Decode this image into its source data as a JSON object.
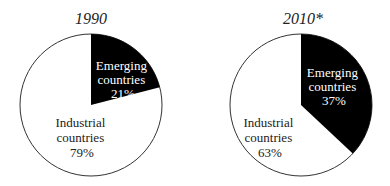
{
  "chart_data": [
    {
      "type": "pie",
      "title": "1990",
      "slices": [
        {
          "label": "Emerging countries",
          "value": 21,
          "display": "21%",
          "color": "#000000"
        },
        {
          "label": "Industrial countries",
          "value": 79,
          "display": "79%",
          "color": "#ffffff"
        }
      ]
    },
    {
      "type": "pie",
      "title": "2010*",
      "slices": [
        {
          "label": "Emerging countries",
          "value": 37,
          "display": "37%",
          "color": "#000000"
        },
        {
          "label": "Industrial countries",
          "value": 63,
          "display": "63%",
          "color": "#ffffff"
        }
      ]
    }
  ],
  "labels": {
    "pie1": {
      "title": "1990",
      "emerging_line1": "Emerging",
      "emerging_line2": "countries",
      "emerging_pct": "21%",
      "industrial_line1": "Industrial",
      "industrial_line2": "countries",
      "industrial_pct": "79%"
    },
    "pie2": {
      "title": "2010*",
      "emerging_line1": "Emerging",
      "emerging_line2": "countries",
      "emerging_pct": "37%",
      "industrial_line1": "Industrial",
      "industrial_line2": "countries",
      "industrial_pct": "63%"
    }
  }
}
